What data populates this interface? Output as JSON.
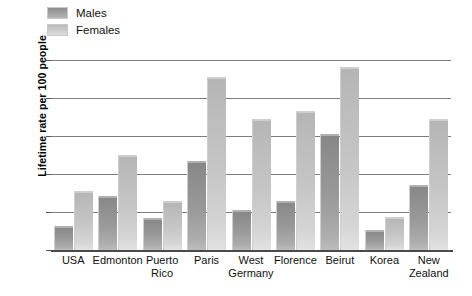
{
  "chart_data": {
    "type": "bar",
    "title": "",
    "subtitle": "",
    "xlabel": "",
    "ylabel": "Lifetime rate per 100 people",
    "ylim": [
      0,
      25
    ],
    "yticks": [
      0,
      5,
      10,
      15,
      20,
      25
    ],
    "ytick_labels": [
      "0",
      "5",
      "10",
      "15",
      "20",
      "25"
    ],
    "grid": true,
    "legend_position": "top-left",
    "categories": [
      "USA",
      "Edmonton",
      "Puerto Rico",
      "Paris",
      "West Germany",
      "Florence",
      "Beirut",
      "Korea",
      "New Zealand"
    ],
    "category_lines": [
      [
        "USA"
      ],
      [
        "Edmonton"
      ],
      [
        "Puerto",
        "Rico"
      ],
      [
        "Paris"
      ],
      [
        "West",
        "Germany"
      ],
      [
        "Florence"
      ],
      [
        "Beirut"
      ],
      [
        "Korea"
      ],
      [
        "New",
        "Zealand"
      ]
    ],
    "series": [
      {
        "name": "Males",
        "color": "#8f8f8f",
        "values": [
          3.2,
          7.1,
          4.2,
          11.7,
          5.2,
          6.4,
          15.3,
          2.6,
          8.5
        ]
      },
      {
        "name": "Females",
        "color": "#bdbdbd",
        "values": [
          7.8,
          12.5,
          6.4,
          22.7,
          17.2,
          18.3,
          24.1,
          4.4,
          17.2
        ]
      }
    ]
  },
  "legend": {
    "items": [
      {
        "label": "Males"
      },
      {
        "label": "Females"
      }
    ]
  },
  "axis": {
    "y_title": "Lifetime rate per 100 people"
  }
}
